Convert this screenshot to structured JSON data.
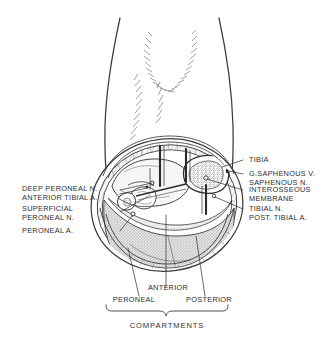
{
  "figure": {
    "title_caption": "COMPARTMENTS"
  },
  "labels_left": [
    {
      "id": "deep-peroneal-nerve",
      "line1": "DEEP PERONEAL N.",
      "line2": "ANTERIOR TIBIAL A."
    },
    {
      "id": "superficial-peroneal-nerve",
      "line1": "SUPERFICIAL",
      "line2": "PERONEAL N."
    },
    {
      "id": "peroneal-artery",
      "line1": "PERONEAL A.",
      "line2": ""
    }
  ],
  "labels_right": [
    {
      "id": "tibia",
      "line1": "TIBIA",
      "line2": ""
    },
    {
      "id": "greater-saphenous-vein",
      "line1": "G.SAPHENOUS V.",
      "line2": "SAPHENOUS  N."
    },
    {
      "id": "interosseous-membrane",
      "line1": "INTEROSSEOUS",
      "line2": "MEMBRANE"
    },
    {
      "id": "tibial-nerve",
      "line1": "TIBIAL N.",
      "line2": "POST. TIBIAL A."
    }
  ],
  "compartments": [
    {
      "id": "anterior",
      "label": "ANTERIOR"
    },
    {
      "id": "peroneal",
      "label": "PERONEAL"
    },
    {
      "id": "posterior",
      "label": "POSTERIOR"
    }
  ],
  "colors": {
    "ink": "#2f2f2f",
    "line": "#3a3a3a",
    "background": "#ffffff",
    "muscle_fill": "#efefef",
    "bone_fill": "#fbfbfb"
  }
}
